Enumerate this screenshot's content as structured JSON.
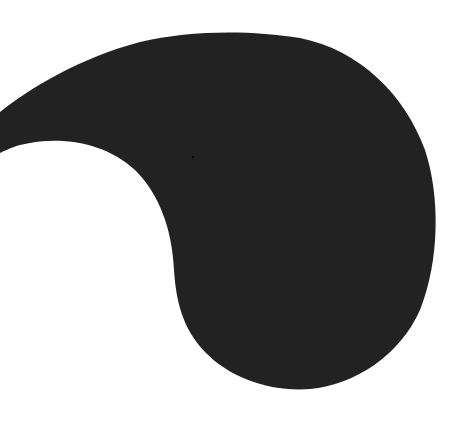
{
  "canvas": {
    "width": 469,
    "height": 425,
    "background": "#ffffff"
  },
  "shape": {
    "name": "paisley-blob",
    "fill": "#222222",
    "speck_color": "#0a0a0a"
  }
}
